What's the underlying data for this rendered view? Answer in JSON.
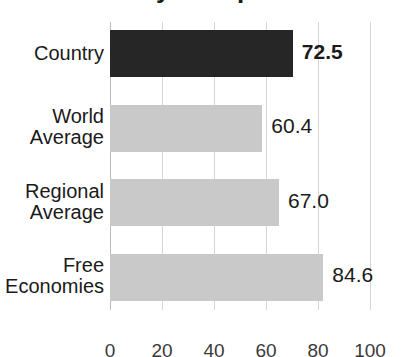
{
  "chart_data": {
    "type": "bar",
    "orientation": "horizontal",
    "title": "Country Comparison",
    "xlabel": "",
    "ylabel": "",
    "categories": [
      "Country",
      "World Average",
      "Regional Average",
      "Free Economies"
    ],
    "category_lines": [
      [
        "Country"
      ],
      [
        "World",
        "Average"
      ],
      [
        "Regional",
        "Average"
      ],
      [
        "Free",
        "Economies"
      ]
    ],
    "values": [
      72.5,
      60.4,
      67.0,
      84.6
    ],
    "value_labels": [
      "72.5",
      "60.4",
      "67.0",
      "84.6"
    ],
    "highlighted_index": 0,
    "xlim": [
      0,
      100
    ],
    "xticks": [
      0,
      20,
      40,
      60,
      80,
      100
    ],
    "xtick_labels": [
      "0",
      "20",
      "40",
      "60",
      "80",
      "100"
    ],
    "grid": true,
    "legend": "none",
    "colors": {
      "highlight_bar": "#262626",
      "default_bar": "#c9c9c9",
      "gridline": "#d5d5d5",
      "text": "#1a1a1a",
      "background": "#ffffff"
    }
  }
}
